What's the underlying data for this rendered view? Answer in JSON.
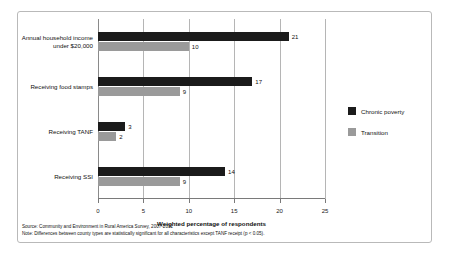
{
  "chart_data": {
    "type": "bar",
    "orientation": "horizontal",
    "categories": [
      "Annual household income under $20,000",
      "Receiving food stamps",
      "Receiving TANF",
      "Receiving SSI"
    ],
    "series": [
      {
        "name": "Chronic poverty",
        "color": "#1b1b1b",
        "values": [
          21,
          17,
          3,
          14
        ]
      },
      {
        "name": "Transition",
        "color": "#9a9a9a",
        "values": [
          10,
          9,
          2,
          9
        ]
      }
    ],
    "title": "",
    "xlabel": "Weighted percentage of respondents",
    "ylabel": "",
    "xlim": [
      0,
      25
    ],
    "xticks": [
      0,
      5,
      10,
      15,
      20,
      25
    ],
    "grid": true,
    "legend_position": "right"
  },
  "category_lines": [
    [
      "Annual household income",
      "under $20,000"
    ],
    [
      "Receiving food stamps"
    ],
    [
      "Receiving TANF"
    ],
    [
      "Receiving SSI"
    ]
  ],
  "footnotes": {
    "source": "Source: Community and Environment in Rural America Survey, 2007-2011",
    "note": "Note: Differences between county types are statistically significant for all characteristics except TANF receipt (p < 0.05)."
  }
}
